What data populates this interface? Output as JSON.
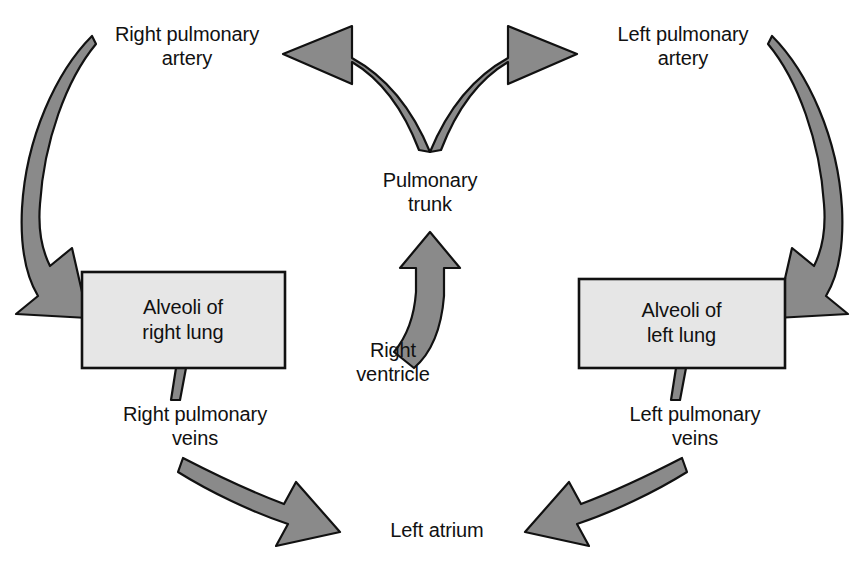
{
  "diagram": {
    "type": "flow-diagram",
    "colors": {
      "arrow_fill": "#8a8a8a",
      "arrow_stroke": "#111111",
      "box_fill": "#e6e6e6",
      "box_stroke": "#111111",
      "text": "#111111",
      "background": "#ffffff"
    },
    "labels": {
      "right_pulmonary_artery": "Right pulmonary\nartery",
      "left_pulmonary_artery": "Left pulmonary\nartery",
      "pulmonary_trunk": "Pulmonary\ntrunk",
      "right_ventricle": "Right\nventricle",
      "right_pulmonary_veins": "Right pulmonary\nveins",
      "left_pulmonary_veins": "Left pulmonary\nveins",
      "left_atrium": "Left atrium"
    },
    "boxes": [
      {
        "id": "right-lung",
        "text": "Alveoli of\nright lung"
      },
      {
        "id": "left-lung",
        "text": "Alveoli of\nleft lung"
      }
    ],
    "flow": [
      {
        "from": "Right ventricle",
        "to": "Pulmonary trunk"
      },
      {
        "from": "Pulmonary trunk",
        "to": "Right pulmonary artery"
      },
      {
        "from": "Pulmonary trunk",
        "to": "Left pulmonary artery"
      },
      {
        "from": "Right pulmonary artery",
        "to": "Alveoli of right lung"
      },
      {
        "from": "Left pulmonary artery",
        "to": "Alveoli of left lung"
      },
      {
        "from": "Alveoli of right lung",
        "to": "Right pulmonary veins"
      },
      {
        "from": "Alveoli of left lung",
        "to": "Left pulmonary veins"
      },
      {
        "from": "Right pulmonary veins",
        "to": "Left atrium"
      },
      {
        "from": "Left pulmonary veins",
        "to": "Left atrium"
      }
    ]
  }
}
